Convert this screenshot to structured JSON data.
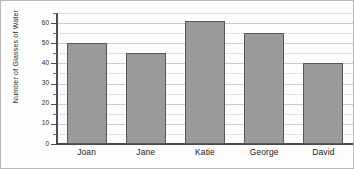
{
  "chart_data": {
    "type": "bar",
    "title": "",
    "xlabel": "",
    "ylabel": "Number of Glasses of Water",
    "categories": [
      "Joan",
      "Jane",
      "Katie",
      "George",
      "David"
    ],
    "values": [
      50,
      45,
      61,
      55,
      40
    ],
    "ylim": [
      0,
      65
    ],
    "ytick_labels": [
      "0",
      "10",
      "20",
      "30",
      "40",
      "50",
      "60"
    ],
    "ytick_values": [
      0,
      10,
      20,
      30,
      40,
      50,
      60
    ],
    "minor_tick_step": 5,
    "grid": true,
    "legend": "none",
    "bar_fill_color": "#9a9a9a",
    "bar_border_color": "#575757",
    "gridline_color": "#c6ccd2",
    "axis_color": "#4a4a4a"
  }
}
